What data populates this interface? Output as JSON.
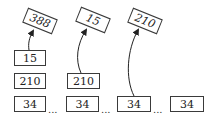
{
  "diagram": {
    "stacks": [
      {
        "cells": [
          "15",
          "210",
          "34"
        ]
      },
      {
        "cells": [
          "210",
          "34"
        ]
      },
      {
        "cells": [
          "34"
        ]
      },
      {
        "cells": [
          "34"
        ]
      }
    ],
    "pointers": [
      {
        "label": "388",
        "from_stack": 0
      },
      {
        "label": "15",
        "from_stack": 1
      },
      {
        "label": "210",
        "from_stack": 2
      }
    ],
    "separator": "..."
  }
}
